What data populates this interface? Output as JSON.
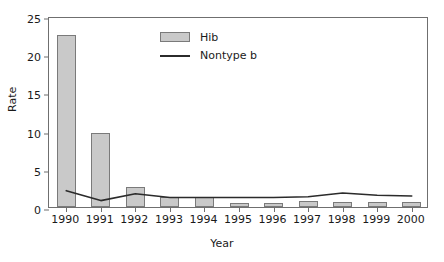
{
  "chart_data": {
    "type": "bar",
    "title": "",
    "xlabel": "Year",
    "ylabel": "Rate",
    "categories": [
      "1990",
      "1991",
      "1992",
      "1993",
      "1994",
      "1995",
      "1996",
      "1997",
      "1998",
      "1999",
      "2000"
    ],
    "ylim": [
      0,
      25
    ],
    "yticks": [
      0,
      5,
      10,
      15,
      20,
      25
    ],
    "ytick_labels": [
      "0",
      "5",
      "10",
      "15",
      "20",
      "25"
    ],
    "grid": false,
    "legend_position": "upper-center",
    "series": [
      {
        "name": "Hib",
        "kind": "bar",
        "color": "#c9c9c9",
        "edge_color": "#7a7a7a",
        "values": [
          22.5,
          9.7,
          2.6,
          1.3,
          1.3,
          0.5,
          0.5,
          0.8,
          0.7,
          0.6,
          0.6
        ]
      },
      {
        "name": "Nontype b",
        "kind": "line",
        "color": "#2b2b2b",
        "values": [
          2.4,
          1.1,
          2.0,
          1.5,
          1.5,
          1.5,
          1.5,
          1.6,
          2.1,
          1.8,
          1.7
        ]
      }
    ]
  },
  "legend": {
    "items": [
      {
        "label": "Hib"
      },
      {
        "label": "Nontype b"
      }
    ]
  },
  "axes": {
    "y_title": "Rate",
    "x_title": "Year"
  }
}
